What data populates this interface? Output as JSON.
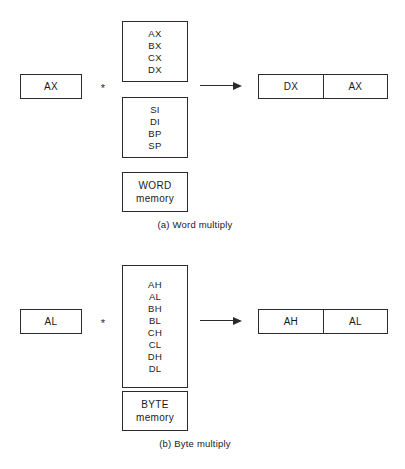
{
  "figure": {
    "background_color": "#ffffff",
    "stroke_color": "#2b2b2b",
    "text_color": "#1a1a1a",
    "operator_symbol": "*"
  },
  "panels": [
    {
      "id": "word-multiply",
      "caption": "(a) Word multiply",
      "left_operand": {
        "label": "AX"
      },
      "operator": "*",
      "right_operands": [
        {
          "id": "word-registers",
          "kind": "register-list",
          "lines": [
            "AX",
            "BX",
            "CX",
            "DX"
          ]
        },
        {
          "id": "word-pointer-registers",
          "kind": "register-list",
          "lines": [
            "SI",
            "DI",
            "BP",
            "SP"
          ]
        },
        {
          "id": "word-memory",
          "kind": "memory",
          "lines": [
            "WORD",
            "memory"
          ]
        }
      ],
      "result": {
        "high": "DX",
        "low": "AX"
      }
    },
    {
      "id": "byte-multiply",
      "caption": "(b) Byte multiply",
      "left_operand": {
        "label": "AL"
      },
      "operator": "*",
      "right_operands": [
        {
          "id": "byte-registers",
          "kind": "register-list",
          "lines": [
            "AH",
            "AL",
            "BH",
            "BL",
            "CH",
            "CL",
            "DH",
            "DL"
          ]
        },
        {
          "id": "byte-memory",
          "kind": "memory",
          "lines": [
            "BYTE",
            "memory"
          ]
        }
      ],
      "result": {
        "high": "AH",
        "low": "AL"
      }
    }
  ]
}
